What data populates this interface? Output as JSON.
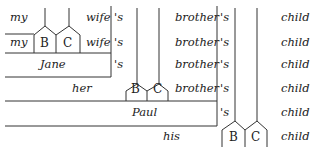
{
  "diagram": {
    "type": "possessive-tree",
    "rows": [
      {
        "words": [
          "my",
          "wife",
          "'s",
          "brother",
          "'s",
          "child"
        ]
      },
      {
        "words": [
          "my",
          "B",
          "C",
          "wife",
          "'s",
          "brother",
          "'s",
          "child"
        ]
      },
      {
        "words": [
          "Jane",
          "'s",
          "brother",
          "'s",
          "child"
        ]
      },
      {
        "words": [
          "her",
          "B",
          "C",
          "brother",
          "'s",
          "child"
        ]
      },
      {
        "words": [
          "Paul",
          "'s",
          "child"
        ]
      },
      {
        "words": [
          "his",
          "B",
          "C",
          "child"
        ]
      }
    ],
    "labels": {
      "r1_my": "my",
      "r1_wife": "wife",
      "r1_s": "'s",
      "r1_brother": "brother",
      "r1_s2": "'s",
      "r1_child": "child",
      "r2_my": "my",
      "r2_B": "B",
      "r2_C": "C",
      "r2_wife": "wife",
      "r2_s": "'s",
      "r2_brother": "brother",
      "r2_s2": "'s",
      "r2_child": "child",
      "r3_jane": "Jane",
      "r3_s": "'s",
      "r3_brother": "brother",
      "r3_s2": "'s",
      "r3_child": "child",
      "r4_her": "her",
      "r4_B": "B",
      "r4_C": "C",
      "r4_brother": "brother",
      "r4_s": "'s",
      "r4_child": "child",
      "r5_paul": "Paul",
      "r5_s": "'s",
      "r5_child": "child",
      "r6_his": "his",
      "r6_B": "B",
      "r6_C": "C",
      "r6_child": "child"
    }
  }
}
